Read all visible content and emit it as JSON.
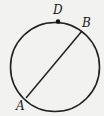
{
  "diagram": {
    "type": "geometry-circle-chord",
    "circle": {
      "cx": 55,
      "cy": 67,
      "r": 44.5
    },
    "points": [
      {
        "label": "D",
        "x": 58,
        "y": 21,
        "marked": true
      },
      {
        "label": "B",
        "x": 82,
        "y": 31,
        "marked": false
      },
      {
        "label": "A",
        "x": 26,
        "y": 100,
        "marked": false
      }
    ],
    "segments": [
      {
        "from": "A",
        "to": "B"
      }
    ],
    "labels": {
      "D": "D",
      "B": "B",
      "A": "A"
    },
    "colors": {
      "stroke": "#222222",
      "background": "#f2f2f0"
    }
  }
}
